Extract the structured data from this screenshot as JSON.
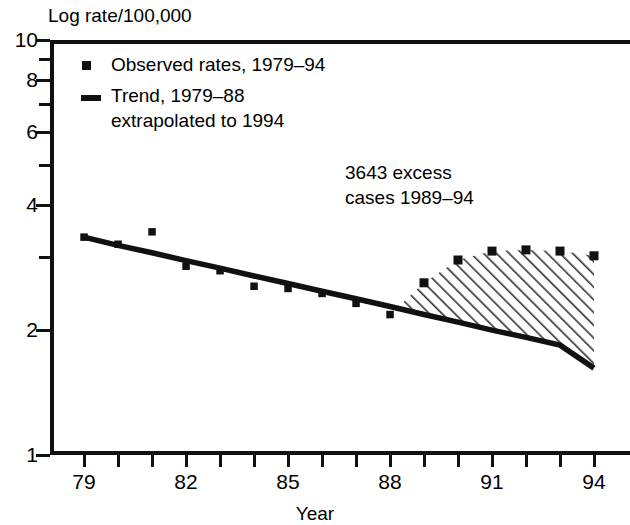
{
  "chart_data": {
    "type": "line",
    "title": "Log rate/100,000",
    "xlabel": "Year",
    "ylabel": "Log rate/100,000",
    "yscale": "log",
    "ylim": [
      1,
      10
    ],
    "xlim": [
      1979,
      1994
    ],
    "grid": false,
    "frame": "top-left-bottom",
    "ytick_labels": [
      "10",
      "8",
      "6",
      "4",
      "2",
      "1"
    ],
    "ytick_values": [
      10,
      8,
      6,
      4,
      2,
      1
    ],
    "ytick_minor_values": [
      9,
      7,
      5,
      3
    ],
    "xtick_values": [
      1979,
      1980,
      1981,
      1982,
      1983,
      1984,
      1985,
      1986,
      1987,
      1988,
      1989,
      1990,
      1991,
      1992,
      1993,
      1994
    ],
    "xtick_labels": [
      "79",
      "",
      "",
      "82",
      "",
      "",
      "85",
      "",
      "",
      "88",
      "",
      "",
      "91",
      "",
      "",
      "94"
    ],
    "x": [
      1979,
      1980,
      1981,
      1982,
      1983,
      1984,
      1985,
      1986,
      1987,
      1988,
      1989,
      1990,
      1991,
      1992,
      1993,
      1994
    ],
    "series": [
      {
        "name": "Observed rates, 1979–94",
        "style": "markers",
        "marker": "square",
        "color": "#111111",
        "values": [
          3.35,
          3.22,
          3.45,
          2.85,
          2.78,
          2.55,
          2.52,
          2.45,
          2.32,
          2.18,
          2.6,
          2.95,
          3.1,
          3.12,
          3.1,
          3.02
        ]
      },
      {
        "name": "Trend, 1979–88 extrapolated to 1994",
        "style": "line",
        "color": "#111111",
        "values": [
          3.35,
          3.2,
          3.07,
          2.94,
          2.82,
          2.7,
          2.59,
          2.48,
          2.38,
          2.28,
          2.18,
          2.09,
          2.0,
          1.92,
          1.84,
          1.62
        ]
      }
    ],
    "shaded_region": {
      "label": "3643 excess cases 1989–94",
      "pattern": "diagonal-hatch",
      "x_start": 1988,
      "x_end": 1994,
      "upper_series": "Observed rates, 1979–94",
      "lower_series": "Trend, 1979–88 extrapolated to 1994"
    },
    "annotations": [
      {
        "text_line1": "3643 excess",
        "text_line2": "cases 1989–94"
      }
    ],
    "legend": {
      "position": "top-left-inside",
      "entries": [
        {
          "marker": "square",
          "label": "Observed rates, 1979–94"
        },
        {
          "marker": "line",
          "label_line1": "Trend, 1979–88",
          "label_line2": "extrapolated to 1994"
        }
      ]
    }
  },
  "axes": {
    "y_title": "Log rate/100,000",
    "x_title": "Year"
  },
  "colors": {
    "ink": "#111111",
    "background": "#ffffff",
    "hatch": "#333333"
  }
}
